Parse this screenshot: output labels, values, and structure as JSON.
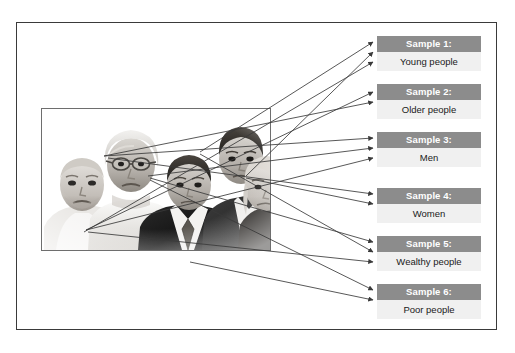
{
  "figure": {
    "canvas": {
      "width": 515,
      "height": 353,
      "background": "#ffffff"
    },
    "frame": {
      "border_color": "#7d7d7d"
    },
    "colors": {
      "header_fill": "#8c8c8c",
      "header_text": "#ffffff",
      "body_fill": "#f0f0f0",
      "body_text": "#1a1a1a",
      "arrow": "#3a3a3a",
      "photo_border": "#6e6e6e"
    }
  },
  "population": {
    "label": "population-photo",
    "description": "Black and white photograph of five people",
    "people": [
      {
        "name": "older-man",
        "position": "far-left"
      },
      {
        "name": "older-woman-glasses",
        "position": "left"
      },
      {
        "name": "man-suit-tie",
        "position": "center"
      },
      {
        "name": "young-man",
        "position": "right"
      },
      {
        "name": "young-woman",
        "position": "far-right"
      }
    ]
  },
  "samples": [
    {
      "id": 1,
      "header": "Sample 1:",
      "body": "Young people",
      "top": 36,
      "arrows": 3
    },
    {
      "id": 2,
      "header": "Sample 2:",
      "body": "Older people",
      "top": 84,
      "arrows": 2
    },
    {
      "id": 3,
      "header": "Sample 3:",
      "body": "Men",
      "top": 132,
      "arrows": 3
    },
    {
      "id": 4,
      "header": "Sample 4:",
      "body": "Women",
      "top": 188,
      "arrows": 2
    },
    {
      "id": 5,
      "header": "Sample 5:",
      "body": "Wealthy people",
      "top": 236,
      "arrows": 3
    },
    {
      "id": 6,
      "header": "Sample 6:",
      "body": "Poor people",
      "top": 284,
      "arrows": 2
    }
  ]
}
